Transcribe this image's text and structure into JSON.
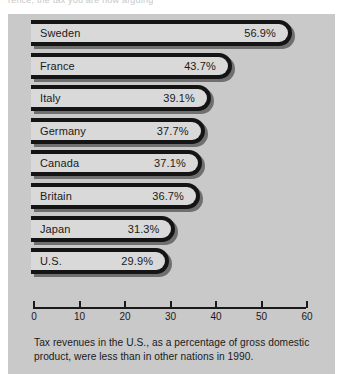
{
  "clipped_top_line": "rence, the tax you are now arguing",
  "colors": {
    "panel_background": "#c9c9c9",
    "bar_fill": "#d9d9d9",
    "bar_outline": "#141414",
    "bar_shadow": "#6f6f6f",
    "text": "#1a1a1a"
  },
  "caption": "Tax revenues in the U.S., as a percentage of gross domestic product, were less than in other nations in 1990.",
  "chart_data": {
    "type": "bar",
    "orientation": "horizontal",
    "title": "",
    "subtitle": "",
    "xlabel": "",
    "ylabel": "",
    "xlim": [
      0,
      60
    ],
    "grid": false,
    "legend": false,
    "categories": [
      "Sweden",
      "France",
      "Italy",
      "Germany",
      "Canada",
      "Britain",
      "Japan",
      "U.S."
    ],
    "values": [
      56.9,
      43.7,
      39.1,
      37.7,
      37.1,
      36.7,
      31.3,
      29.9
    ],
    "value_labels": [
      "56.9%",
      "43.7%",
      "39.1%",
      "37.7%",
      "37.1%",
      "36.7%",
      "31.3%",
      "29.9%"
    ],
    "tick_values": [
      0,
      10,
      20,
      30,
      40,
      50,
      60
    ],
    "tick_labels": [
      "0",
      "10",
      "20",
      "30",
      "40",
      "50",
      "60"
    ]
  }
}
